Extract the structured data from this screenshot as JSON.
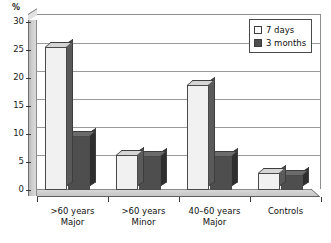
{
  "chart_data": {
    "type": "bar",
    "title": "",
    "subtitle": "",
    "xlabel": "",
    "ylabel": "%",
    "ylim": [
      0,
      30
    ],
    "ytick_labels": [
      "0",
      "5",
      "10",
      "15",
      "20",
      "25",
      "30"
    ],
    "ytick_values": [
      0,
      5,
      10,
      15,
      20,
      25,
      30
    ],
    "grid": true,
    "style": "3d-column",
    "legend_position": "top-right",
    "categories": [
      ">60 years Major",
      ">60 years Minor",
      "40–60 years Major",
      "Controls"
    ],
    "category_lines": [
      [
        ">60 years",
        "Major"
      ],
      [
        ">60 years",
        "Minor"
      ],
      [
        "40–60 years",
        "Major"
      ],
      [
        "Controls",
        ""
      ]
    ],
    "series": [
      {
        "name": "7 days",
        "color": "#f1f1f1",
        "values": [
          25.5,
          6.3,
          18.8,
          3.0
        ]
      },
      {
        "name": "3 months",
        "color": "#4e4e4e",
        "values": [
          9.7,
          6.0,
          6.0,
          2.7
        ]
      }
    ]
  },
  "legend": {
    "items": [
      {
        "label": "7 days",
        "swatch": "light"
      },
      {
        "label": "3 months",
        "swatch": "dark"
      }
    ]
  },
  "axis": {
    "y_unit_label": "%"
  }
}
